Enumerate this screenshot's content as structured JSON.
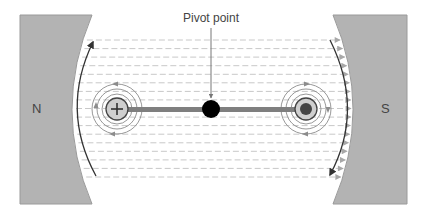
{
  "diagram": {
    "title_label": "Pivot point",
    "north_pole_label": "N",
    "south_pole_label": "S",
    "left_conductor_symbol": "+",
    "right_conductor_symbol": "•",
    "field_line_count": 17
  },
  "colors": {
    "magnet_fill": "#b3b3b3",
    "magnet_stroke": "#9a9a9a",
    "field_dash": "#c8c8c8",
    "field_arrow": "#a8a8a8",
    "rotation_arrow": "#333333",
    "circle_field": "#8c8c8c",
    "conductor_fill": "#cfcfcf",
    "conductor_stroke": "#444444",
    "bar": "#7f7f7f",
    "pivot": "#000000",
    "label": "#444444"
  }
}
